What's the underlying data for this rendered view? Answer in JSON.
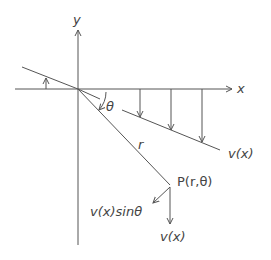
{
  "labels": {
    "y_axis": "y",
    "x_axis": "x",
    "theta": "θ",
    "r": "r",
    "load_line": "v(x)",
    "point": "P(r,θ)",
    "component": "v(x)sinθ",
    "vertical_force": "v(x)"
  },
  "colors": {
    "line": "#555555",
    "text": "#444444"
  }
}
